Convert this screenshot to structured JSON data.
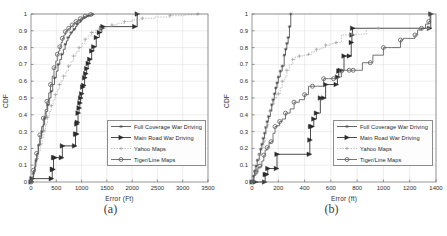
{
  "figure": {
    "panels": [
      {
        "id": "a",
        "caption": "(a)",
        "chart_data": {
          "type": "line",
          "title": "",
          "xlabel": "Error (Ft)",
          "ylabel": "CDF",
          "xlim": [
            0,
            3500
          ],
          "ylim": [
            0,
            1
          ],
          "xticks": [
            0,
            500,
            1000,
            1500,
            2000,
            2500,
            3000,
            3500
          ],
          "yticks": [
            0,
            0.1,
            0.2,
            0.3,
            0.4,
            0.5,
            0.6,
            0.7,
            0.8,
            0.9,
            1
          ],
          "grid": true,
          "legend_position": "center-right",
          "series": [
            {
              "name": "Full Coverage War Driving",
              "marker": "dot-line",
              "color": "#4a4a4a",
              "x": [
                0,
                20,
                45,
                70,
                95,
                120,
                150,
                180,
                210,
                240,
                270,
                300,
                330,
                360,
                395,
                430,
                465,
                500,
                535,
                570,
                605,
                640,
                675,
                700,
                730,
                760,
                790,
                820,
                850,
                880,
                910,
                945,
                980,
                1010,
                1050,
                1090,
                1130,
                1175,
                1215,
                1250
              ],
              "y": [
                0.0,
                0.02,
                0.05,
                0.09,
                0.13,
                0.17,
                0.22,
                0.26,
                0.3,
                0.34,
                0.38,
                0.42,
                0.46,
                0.5,
                0.54,
                0.58,
                0.62,
                0.66,
                0.7,
                0.73,
                0.76,
                0.79,
                0.82,
                0.84,
                0.86,
                0.875,
                0.89,
                0.9,
                0.91,
                0.925,
                0.94,
                0.95,
                0.96,
                0.97,
                0.98,
                0.985,
                0.99,
                0.995,
                0.998,
                1.0
              ]
            },
            {
              "name": "Main Road War Driving",
              "marker": "triangle-right",
              "color": "#2b2b2b",
              "x": [
                0,
                20,
                400,
                420,
                430,
                445,
                470,
                600,
                620,
                860,
                880,
                900,
                905,
                915,
                930,
                950,
                965,
                980,
                1000,
                1020,
                1040,
                1060,
                1080,
                1100,
                1130,
                1160,
                1200,
                1240,
                1290,
                1350,
                1400,
                1420,
                2050,
                2100
              ],
              "y": [
                0.0,
                0.02,
                0.02,
                0.075,
                0.075,
                0.145,
                0.145,
                0.145,
                0.215,
                0.215,
                0.285,
                0.285,
                0.345,
                0.355,
                0.41,
                0.44,
                0.47,
                0.5,
                0.525,
                0.565,
                0.575,
                0.62,
                0.645,
                0.675,
                0.705,
                0.73,
                0.78,
                0.805,
                0.86,
                0.89,
                0.915,
                0.925,
                0.925,
                1.0
              ]
            },
            {
              "name": "Yahoo Maps",
              "marker": "plus-dotted",
              "color": "#9b9b9b",
              "x": [
                0,
                25,
                55,
                85,
                115,
                150,
                185,
                220,
                255,
                290,
                325,
                360,
                400,
                440,
                480,
                520,
                560,
                600,
                640,
                690,
                740,
                790,
                840,
                890,
                950,
                1010,
                1070,
                1130,
                1200,
                1280,
                1370,
                1480,
                1600,
                1700,
                1850,
                2000,
                2200,
                2450,
                2750,
                3050,
                3300
              ],
              "y": [
                0.0,
                0.025,
                0.06,
                0.1,
                0.14,
                0.185,
                0.225,
                0.265,
                0.305,
                0.345,
                0.385,
                0.42,
                0.455,
                0.49,
                0.52,
                0.55,
                0.58,
                0.605,
                0.63,
                0.66,
                0.69,
                0.72,
                0.75,
                0.775,
                0.8,
                0.825,
                0.85,
                0.87,
                0.89,
                0.905,
                0.915,
                0.925,
                0.935,
                0.945,
                0.955,
                0.965,
                0.975,
                0.982,
                0.99,
                0.995,
                1.0
              ]
            },
            {
              "name": "Tiger/Line Maps",
              "marker": "circle",
              "color": "#5c5c5c",
              "x": [
                0,
                25,
                50,
                80,
                110,
                140,
                175,
                210,
                245,
                280,
                315,
                350,
                385,
                420,
                455,
                490,
                520,
                545,
                570,
                595,
                620,
                650,
                680,
                710,
                745,
                780,
                815,
                850,
                890,
                930,
                975,
                1020,
                1070,
                1120,
                1180,
                1240
              ],
              "y": [
                0.0,
                0.03,
                0.07,
                0.12,
                0.17,
                0.22,
                0.28,
                0.33,
                0.38,
                0.43,
                0.48,
                0.53,
                0.58,
                0.63,
                0.68,
                0.72,
                0.76,
                0.78,
                0.805,
                0.83,
                0.855,
                0.875,
                0.895,
                0.905,
                0.915,
                0.925,
                0.935,
                0.945,
                0.955,
                0.965,
                0.972,
                0.98,
                0.987,
                0.993,
                0.997,
                1.0
              ]
            }
          ]
        }
      },
      {
        "id": "b",
        "caption": "(b)",
        "chart_data": {
          "type": "line",
          "title": "",
          "xlabel": "Error (ft)",
          "ylabel": "CDF",
          "xlim": [
            0,
            1400
          ],
          "ylim": [
            0,
            1
          ],
          "xticks": [
            0,
            200,
            400,
            600,
            800,
            1000,
            1200,
            1400
          ],
          "yticks": [
            0,
            0.1,
            0.2,
            0.3,
            0.4,
            0.5,
            0.6,
            0.7,
            0.8,
            0.9,
            1
          ],
          "grid": true,
          "legend_position": "center-right",
          "series": [
            {
              "name": "Full Coverage War Driving",
              "marker": "dot-line",
              "color": "#4a4a4a",
              "x": [
                0,
                10,
                20,
                30,
                40,
                55,
                65,
                75,
                85,
                95,
                105,
                115,
                125,
                140,
                150,
                160,
                170,
                180,
                190,
                200,
                215,
                230,
                245,
                255,
                265,
                275,
                285,
                295
              ],
              "y": [
                0.0,
                0.035,
                0.065,
                0.095,
                0.13,
                0.165,
                0.195,
                0.225,
                0.26,
                0.29,
                0.325,
                0.36,
                0.39,
                0.425,
                0.46,
                0.49,
                0.525,
                0.56,
                0.59,
                0.625,
                0.66,
                0.69,
                0.755,
                0.79,
                0.825,
                0.86,
                0.925,
                1.0
              ]
            },
            {
              "name": "Main Road War Driving",
              "marker": "triangle-right",
              "color": "#2b2b2b",
              "x": [
                0,
                25,
                95,
                100,
                110,
                120,
                185,
                190,
                435,
                440,
                445,
                455,
                470,
                490,
                520,
                545,
                560,
                640,
                650,
                660,
                670,
                700,
                740,
                755,
                760,
                765,
                1350,
                1360
              ],
              "y": [
                0.0,
                0.0,
                0.0,
                0.045,
                0.045,
                0.08,
                0.08,
                0.165,
                0.165,
                0.25,
                0.33,
                0.33,
                0.375,
                0.41,
                0.5,
                0.5,
                0.58,
                0.58,
                0.625,
                0.66,
                0.665,
                0.75,
                0.75,
                0.83,
                0.875,
                0.915,
                0.915,
                1.0
              ]
            },
            {
              "name": "Yahoo Maps",
              "marker": "plus-dotted",
              "color": "#9b9b9b",
              "x": [
                0,
                15,
                30,
                45,
                60,
                75,
                90,
                100,
                110,
                125,
                140,
                155,
                170,
                185,
                200,
                215,
                230,
                250,
                265,
                285,
                310,
                330,
                360,
                395,
                430,
                455,
                490,
                530,
                560,
                600,
                640,
                680,
                760,
                870,
                960,
                1020,
                1340,
                1355
              ],
              "y": [
                0.0,
                0.045,
                0.075,
                0.105,
                0.165,
                0.2,
                0.24,
                0.29,
                0.33,
                0.38,
                0.42,
                0.46,
                0.5,
                0.52,
                0.525,
                0.56,
                0.6,
                0.625,
                0.665,
                0.7,
                0.73,
                0.745,
                0.75,
                0.755,
                0.76,
                0.775,
                0.79,
                0.8,
                0.815,
                0.825,
                0.83,
                0.875,
                0.88,
                0.915,
                0.915,
                0.915,
                0.915,
                1.0
              ]
            },
            {
              "name": "Tiger/Line Maps",
              "marker": "circle",
              "color": "#5c5c5c",
              "x": [
                0,
                15,
                30,
                45,
                60,
                75,
                90,
                100,
                115,
                130,
                145,
                160,
                175,
                190,
                210,
                230,
                255,
                290,
                320,
                360,
                400,
                430,
                460,
                500,
                545,
                580,
                620,
                655,
                680,
                700,
                740,
                760,
                770,
                840,
                900,
                920,
                1000,
                1060,
                1130,
                1150,
                1240,
                1260,
                1290,
                1320,
                1345,
                1355
              ],
              "y": [
                0.0,
                0.04,
                0.06,
                0.085,
                0.095,
                0.125,
                0.16,
                0.19,
                0.205,
                0.235,
                0.24,
                0.29,
                0.33,
                0.335,
                0.36,
                0.375,
                0.41,
                0.435,
                0.475,
                0.49,
                0.52,
                0.57,
                0.57,
                0.57,
                0.615,
                0.615,
                0.615,
                0.625,
                0.66,
                0.665,
                0.665,
                0.665,
                0.665,
                0.71,
                0.71,
                0.755,
                0.8,
                0.8,
                0.845,
                0.855,
                0.875,
                0.905,
                0.915,
                0.94,
                0.955,
                1.0
              ]
            }
          ]
        }
      }
    ],
    "legend_labels": [
      "Full Coverage War Driving",
      "Main Road War Driving",
      "Yahoo Maps",
      "Tiger/Line Maps"
    ]
  }
}
